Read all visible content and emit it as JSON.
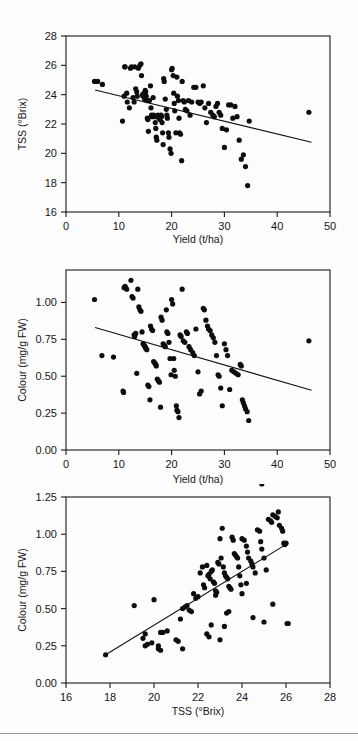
{
  "figure": {
    "background_color": "#fdfdfd",
    "point_color": "#0d0d0d",
    "line_color": "#111111",
    "axis_color": "#1a1a1a",
    "panel_count": 3
  },
  "chart_data": [
    {
      "id": "panel-1",
      "type": "scatter",
      "title": "",
      "xlabel": "Yield (t/ha)",
      "ylabel": "TSS (°Brix)",
      "xlim": [
        0,
        50
      ],
      "ylim": [
        16,
        28
      ],
      "xticks": [
        0,
        10,
        20,
        30,
        40,
        50
      ],
      "yticks": [
        16,
        18,
        20,
        22,
        24,
        26,
        28
      ],
      "xtick_labels": [
        "0",
        "10",
        "20",
        "30",
        "40",
        "50"
      ],
      "ytick_labels": [
        "16",
        "18",
        "20",
        "22",
        "24",
        "26",
        "28"
      ],
      "grid": false,
      "legend": null,
      "trendline": {
        "x": [
          5.5,
          46.5
        ],
        "y": [
          24.32,
          20.75
        ]
      },
      "x": [
        5.4,
        6.0,
        6.9,
        10.7,
        11.0,
        11.1,
        11.2,
        11.5,
        11.6,
        12.0,
        12.2,
        12.4,
        12.7,
        12.9,
        13.0,
        13.2,
        13.4,
        13.5,
        13.7,
        14.0,
        14.2,
        14.3,
        14.5,
        14.6,
        14.8,
        14.9,
        15.0,
        15.1,
        15.2,
        15.3,
        15.4,
        15.5,
        15.6,
        15.8,
        16.0,
        16.1,
        16.2,
        16.3,
        16.5,
        16.6,
        16.8,
        16.9,
        17.0,
        17.1,
        17.2,
        17.4,
        17.5,
        17.6,
        17.8,
        18.0,
        18.1,
        18.2,
        18.3,
        18.4,
        18.5,
        18.6,
        18.8,
        19.0,
        19.1,
        19.2,
        19.4,
        19.5,
        19.7,
        19.9,
        20.0,
        20.1,
        20.3,
        20.4,
        20.5,
        20.6,
        20.8,
        21.0,
        21.1,
        21.3,
        21.4,
        21.5,
        21.7,
        21.9,
        22.0,
        22.2,
        22.4,
        22.6,
        22.9,
        23.2,
        23.5,
        23.8,
        24.2,
        24.6,
        25.0,
        25.3,
        25.6,
        26.0,
        26.3,
        26.6,
        27.0,
        27.4,
        27.8,
        28.1,
        28.4,
        28.7,
        29.0,
        29.3,
        29.6,
        30.0,
        30.4,
        30.8,
        31.2,
        31.6,
        32.0,
        32.4,
        32.8,
        33.2,
        33.6,
        34.0,
        34.4,
        34.7,
        46.0
      ],
      "y": [
        24.9,
        24.9,
        24.7,
        22.2,
        23.9,
        25.9,
        25.9,
        24.1,
        23.5,
        23.1,
        25.8,
        25.9,
        23.8,
        23.5,
        25.9,
        24.4,
        24.2,
        23.9,
        25.8,
        26.0,
        26.1,
        25.3,
        24.0,
        23.9,
        24.1,
        23.7,
        24.3,
        24.2,
        23.9,
        23.6,
        22.4,
        22.3,
        21.5,
        23.6,
        24.6,
        23.1,
        22.6,
        22.5,
        23.8,
        22.6,
        22.5,
        22.1,
        21.7,
        21.1,
        20.9,
        22.6,
        22.5,
        22.4,
        22.3,
        22.6,
        22.5,
        22.1,
        21.4,
        20.6,
        25.1,
        24.9,
        23.7,
        23.0,
        22.6,
        22.4,
        21.4,
        21.1,
        20.3,
        20.0,
        25.7,
        25.8,
        25.3,
        24.1,
        23.4,
        22.9,
        21.4,
        25.2,
        23.9,
        23.6,
        22.4,
        21.4,
        21.3,
        19.5,
        24.9,
        23.6,
        23.5,
        23.0,
        22.9,
        23.6,
        22.6,
        23.5,
        24.5,
        24.5,
        23.5,
        23.4,
        23.5,
        24.6,
        23.1,
        22.1,
        23.4,
        22.8,
        22.6,
        22.5,
        23.2,
        23.4,
        22.8,
        22.6,
        21.7,
        20.4,
        21.6,
        23.3,
        23.3,
        22.4,
        23.2,
        22.5,
        20.9,
        19.6,
        19.9,
        19.1,
        17.8,
        22.2,
        22.8
      ]
    },
    {
      "id": "panel-2",
      "type": "scatter",
      "title": "",
      "xlabel": "Yield (t/ha)",
      "ylabel": "Colour (mg/g FW)",
      "xlim": [
        0,
        50
      ],
      "ylim": [
        0.0,
        1.22
      ],
      "xticks": [
        0,
        10,
        20,
        30,
        40,
        50
      ],
      "yticks": [
        0.0,
        0.25,
        0.5,
        0.75,
        1.0
      ],
      "xtick_labels": [
        "0",
        "10",
        "20",
        "30",
        "40",
        "50"
      ],
      "ytick_labels": [
        "0.00",
        "0.25",
        "0.50",
        "0.75",
        "1.00"
      ],
      "grid": false,
      "legend": null,
      "trendline": {
        "x": [
          5.5,
          46.5
        ],
        "y": [
          0.83,
          0.405
        ]
      },
      "x": [
        5.4,
        6.8,
        9.0,
        10.8,
        10.9,
        11.0,
        11.2,
        11.5,
        12.3,
        12.5,
        12.7,
        12.9,
        13.0,
        13.2,
        13.4,
        13.6,
        13.8,
        14.0,
        14.2,
        14.4,
        14.6,
        14.8,
        15.0,
        15.1,
        15.3,
        15.5,
        15.7,
        15.9,
        16.0,
        16.2,
        16.4,
        16.6,
        16.8,
        17.0,
        17.1,
        17.3,
        17.5,
        17.7,
        17.9,
        18.0,
        18.2,
        18.4,
        18.6,
        18.8,
        19.0,
        19.1,
        19.3,
        19.5,
        19.7,
        19.9,
        20.0,
        20.2,
        20.4,
        20.5,
        20.7,
        20.9,
        21.0,
        21.2,
        21.4,
        21.6,
        21.8,
        22.0,
        22.2,
        22.5,
        22.8,
        23.0,
        23.3,
        23.6,
        24.0,
        24.3,
        24.6,
        25.0,
        25.3,
        25.6,
        26.0,
        26.2,
        26.5,
        26.8,
        27.0,
        27.3,
        27.6,
        27.9,
        28.2,
        28.5,
        28.8,
        29.0,
        29.3,
        29.6,
        30.0,
        30.3,
        30.6,
        31.0,
        31.4,
        31.8,
        32.2,
        32.6,
        33.0,
        33.2,
        33.4,
        33.6,
        33.8,
        34.0,
        34.3,
        34.6,
        46.0
      ],
      "y": [
        1.02,
        0.64,
        0.63,
        0.4,
        0.39,
        1.1,
        1.11,
        1.09,
        1.15,
        1.04,
        1.03,
        0.78,
        0.77,
        0.79,
        0.52,
        1.09,
        0.97,
        0.95,
        0.94,
        0.8,
        0.72,
        0.71,
        0.7,
        0.69,
        0.68,
        0.44,
        0.43,
        0.34,
        0.84,
        0.82,
        0.81,
        0.6,
        0.59,
        0.58,
        0.57,
        0.48,
        0.47,
        0.46,
        0.29,
        0.9,
        0.88,
        0.72,
        0.71,
        0.7,
        0.95,
        0.8,
        0.79,
        0.73,
        0.62,
        0.51,
        1.02,
        0.99,
        0.62,
        0.54,
        0.5,
        0.3,
        0.27,
        0.26,
        0.22,
        0.78,
        0.77,
        1.09,
        0.74,
        0.73,
        0.8,
        0.79,
        0.7,
        0.68,
        0.66,
        0.64,
        0.82,
        0.53,
        0.38,
        0.4,
        0.96,
        0.95,
        0.88,
        0.84,
        0.82,
        0.81,
        0.78,
        0.76,
        0.73,
        0.64,
        0.51,
        0.5,
        0.42,
        0.3,
        0.72,
        0.68,
        0.64,
        0.41,
        0.54,
        0.53,
        0.52,
        0.51,
        0.58,
        0.57,
        0.34,
        0.32,
        0.3,
        0.28,
        0.26,
        0.2,
        0.74
      ]
    },
    {
      "id": "panel-3",
      "type": "scatter",
      "title": "",
      "xlabel": "TSS (°Brix)",
      "ylabel": "Colour (mg/g FW)",
      "xlim": [
        16,
        28
      ],
      "ylim": [
        0.0,
        1.25
      ],
      "xticks": [
        16,
        18,
        20,
        22,
        24,
        26,
        28
      ],
      "yticks": [
        0.0,
        0.25,
        0.5,
        0.75,
        1.0,
        1.25
      ],
      "xtick_labels": [
        "16",
        "18",
        "20",
        "22",
        "24",
        "26",
        "28"
      ],
      "ytick_labels": [
        "0.00",
        "0.25",
        "0.50",
        "0.75",
        "1.00",
        "1.25"
      ],
      "grid": false,
      "legend": null,
      "trendline": {
        "x": [
          17.8,
          26.1
        ],
        "y": [
          0.19,
          0.94
        ]
      },
      "x": [
        17.8,
        19.1,
        19.5,
        19.6,
        19.7,
        19.9,
        20.0,
        20.2,
        20.3,
        20.4,
        20.6,
        21.0,
        21.1,
        21.2,
        21.3,
        21.4,
        21.5,
        21.6,
        21.7,
        21.8,
        21.9,
        22.0,
        22.1,
        22.2,
        22.25,
        22.3,
        22.4,
        22.45,
        22.5,
        22.55,
        22.6,
        22.65,
        22.7,
        22.75,
        22.8,
        22.85,
        22.9,
        22.95,
        23.0,
        23.05,
        23.1,
        23.15,
        23.2,
        23.25,
        23.3,
        23.35,
        23.4,
        23.45,
        23.5,
        23.55,
        23.6,
        23.65,
        23.7,
        23.75,
        23.8,
        23.85,
        23.9,
        23.95,
        24.0,
        24.1,
        24.2,
        24.25,
        24.3,
        24.4,
        24.45,
        24.5,
        24.6,
        24.7,
        24.8,
        24.85,
        24.9,
        25.0,
        25.1,
        25.2,
        25.3,
        25.35,
        25.4,
        25.5,
        25.6,
        25.65,
        25.7,
        25.8,
        25.85,
        25.9,
        25.95,
        26.0,
        26.05,
        26.1,
        22.6,
        23.3,
        23.4,
        24.0,
        24.2,
        24.5,
        25.0,
        25.4,
        22.8,
        23.0,
        21.3,
        20.2,
        19.6,
        20.3,
        22.4,
        22.5,
        23.2,
        24.9
      ],
      "y": [
        0.19,
        0.52,
        0.3,
        0.25,
        0.26,
        0.27,
        0.56,
        0.23,
        0.22,
        0.34,
        0.35,
        0.29,
        0.28,
        0.43,
        0.5,
        0.51,
        0.52,
        0.49,
        0.48,
        0.6,
        0.57,
        0.58,
        0.74,
        0.78,
        0.66,
        0.64,
        0.79,
        0.72,
        0.73,
        0.7,
        0.75,
        0.76,
        0.68,
        0.67,
        0.62,
        0.61,
        0.81,
        0.8,
        0.97,
        0.84,
        1.04,
        0.78,
        0.74,
        0.72,
        0.71,
        0.7,
        0.65,
        0.64,
        0.63,
        0.98,
        0.96,
        0.87,
        0.86,
        0.85,
        0.84,
        0.78,
        0.72,
        0.66,
        0.97,
        0.96,
        0.92,
        0.88,
        0.84,
        0.82,
        0.8,
        0.78,
        0.74,
        1.03,
        1.02,
        0.95,
        0.9,
        0.84,
        0.76,
        1.1,
        1.09,
        1.08,
        1.13,
        1.12,
        1.11,
        1.15,
        1.06,
        1.04,
        1.02,
        0.94,
        0.93,
        0.94,
        0.4,
        0.4,
        0.39,
        0.47,
        0.48,
        0.6,
        0.67,
        0.44,
        0.41,
        0.53,
        0.59,
        0.29,
        0.23,
        0.25,
        0.33,
        0.34,
        0.33,
        0.31,
        0.38
      ]
    }
  ]
}
